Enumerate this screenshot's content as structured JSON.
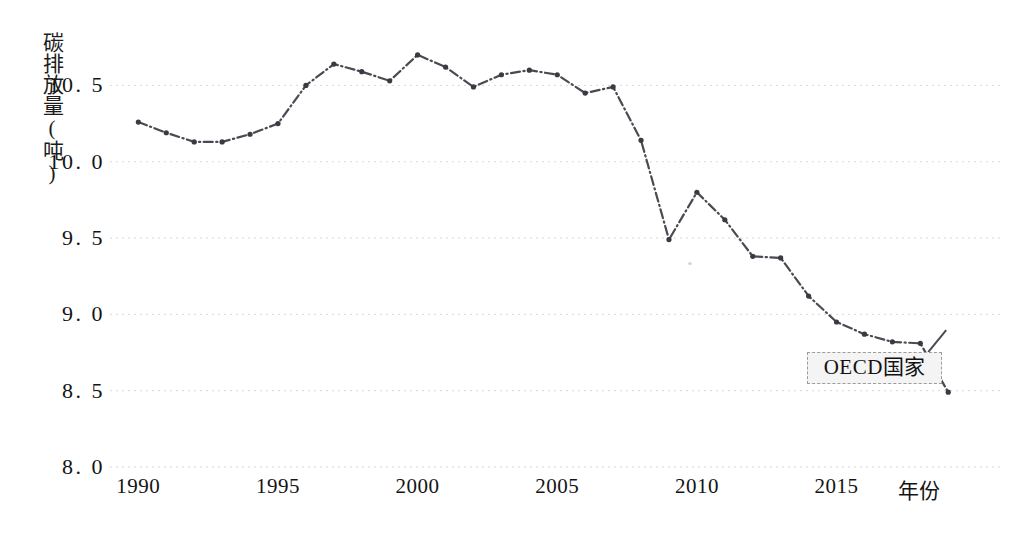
{
  "chart_data": {
    "type": "line",
    "title": "",
    "xlabel": "年份",
    "ylabel": "碳排放量(吨)",
    "xlim": [
      1989.2,
      2019.6
    ],
    "ylim": [
      8.0,
      10.85
    ],
    "grid": true,
    "grid_style": "dotted-horizontal",
    "legend_position": "inline-annotation-bottom-right",
    "x": [
      1990,
      1991,
      1992,
      1993,
      1994,
      1995,
      1996,
      1997,
      1998,
      1999,
      2000,
      2001,
      2002,
      2003,
      2004,
      2005,
      2006,
      2007,
      2008,
      2009,
      2010,
      2011,
      2012,
      2013,
      2014,
      2015,
      2016,
      2017,
      2018,
      2019
    ],
    "categories": [
      "1990",
      "1991",
      "1992",
      "1993",
      "1994",
      "1995",
      "1996",
      "1997",
      "1998",
      "1999",
      "2000",
      "2001",
      "2002",
      "2003",
      "2004",
      "2005",
      "2006",
      "2007",
      "2008",
      "2009",
      "2010",
      "2011",
      "2012",
      "2013",
      "2014",
      "2015",
      "2016",
      "2017",
      "2018",
      "2019"
    ],
    "series": [
      {
        "name": "OECD国家",
        "color": "#4a4a52",
        "line_style": "dash-dot",
        "marker": "circle",
        "values": [
          10.26,
          10.19,
          10.13,
          10.13,
          10.18,
          10.25,
          10.5,
          10.64,
          10.59,
          10.53,
          10.7,
          10.62,
          10.49,
          10.57,
          10.6,
          10.57,
          10.45,
          10.49,
          10.14,
          9.49,
          9.8,
          9.62,
          9.38,
          9.37,
          9.12,
          8.95,
          8.87,
          8.82,
          8.81,
          8.49
        ]
      }
    ],
    "y_ticks": [
      8.0,
      8.5,
      9.0,
      9.5,
      10.0,
      10.5
    ],
    "y_tick_labels": [
      "8. 0",
      "8. 5",
      "9. 0",
      "9. 5",
      "10. 0",
      "10. 5"
    ],
    "x_ticks": [
      1990,
      1995,
      2000,
      2005,
      2010,
      2015
    ],
    "x_tick_labels": [
      "1990",
      "1995",
      "2000",
      "2005",
      "2010",
      "2015"
    ],
    "annotations": [
      {
        "text": "OECD国家",
        "target_x": 2019,
        "target_y": 8.49,
        "style": "boxed-label-with-leader-line"
      }
    ]
  },
  "colors": {
    "line": "#4a4a52",
    "marker": "#3a3a42",
    "grid": "#d8d8dc",
    "text": "#141414",
    "annotation_bg": "#f4f4f4",
    "annotation_border": "#9b9b9b",
    "background": "#ffffff"
  }
}
